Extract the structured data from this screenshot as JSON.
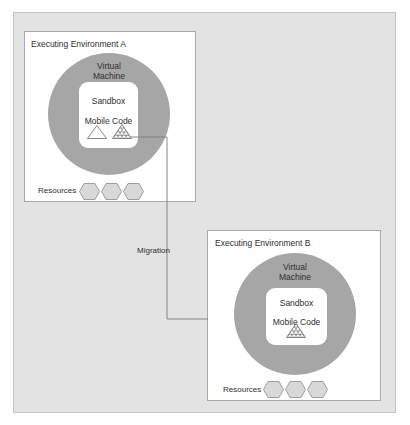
{
  "diagram": {
    "colors": {
      "background": "#ffffff",
      "outer_panel": "#e3e3e3",
      "environment_box": "#ffffff",
      "virtual_machine": "#a6a6a6",
      "sandbox": "#ffffff",
      "resource_hexagon": "#d8d8d8",
      "connector_line": "#7a7a7a",
      "text": "#2e2e2e"
    },
    "environments": [
      {
        "id": "A",
        "title": "Executing Environment A",
        "virtual_machine": {
          "label_line1": "Virtual",
          "label_line2": "Machine"
        },
        "sandbox": {
          "label": "Sandbox",
          "code_label": "Mobile Code",
          "code_items": [
            "plain-triangle-icon",
            "hatched-triangle-icon"
          ]
        },
        "resources": {
          "label": "Resources",
          "count": 3
        }
      },
      {
        "id": "B",
        "title": "Executing Environment B",
        "virtual_machine": {
          "label_line1": "Virtual",
          "label_line2": "Machine"
        },
        "sandbox": {
          "label": "Sandbox",
          "code_label": "Mobile Code",
          "code_items": [
            "hatched-triangle-icon"
          ]
        },
        "resources": {
          "label": "Resources",
          "count": 3
        }
      }
    ],
    "connector": {
      "label": "Migration",
      "from": "A.hatched-triangle",
      "to": "B"
    }
  }
}
